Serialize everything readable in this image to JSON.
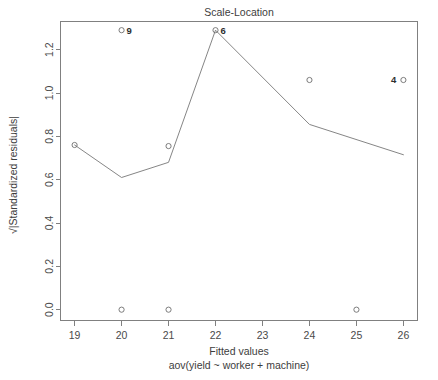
{
  "chart_data": {
    "type": "scatter",
    "title": "Scale-Location",
    "xlabel": "Fitted values",
    "sublabel": "aov(yield ~ worker + machine)",
    "ylabel": "√|Standardized residuals|",
    "ylabel_radical": "√",
    "ylabel_text": "|Standardized residuals|",
    "xlim": [
      18.7,
      26.3
    ],
    "ylim": [
      -0.05,
      1.33
    ],
    "grid": false,
    "legend": "none",
    "x_ticks": [
      "19",
      "20",
      "21",
      "22",
      "23",
      "24",
      "25",
      "26"
    ],
    "x_tick_values": [
      19,
      20,
      21,
      22,
      23,
      24,
      25,
      26
    ],
    "y_ticks": [
      "0.0",
      "0.2",
      "0.4",
      "0.6",
      "0.8",
      "1.0",
      "1.2"
    ],
    "y_tick_values": [
      0.0,
      0.2,
      0.4,
      0.6,
      0.8,
      1.0,
      1.2
    ],
    "points": [
      {
        "x": 19.0,
        "y": 0.76,
        "label": "",
        "label_side": "none"
      },
      {
        "x": 20.0,
        "y": 1.29,
        "label": "9",
        "label_side": "right"
      },
      {
        "x": 20.0,
        "y": 0.0,
        "label": "",
        "label_side": "none"
      },
      {
        "x": 21.0,
        "y": 0.755,
        "label": "",
        "label_side": "none"
      },
      {
        "x": 21.0,
        "y": 0.0,
        "label": "",
        "label_side": "none"
      },
      {
        "x": 22.0,
        "y": 1.29,
        "label": "6",
        "label_side": "right"
      },
      {
        "x": 24.0,
        "y": 1.06,
        "label": "",
        "label_side": "none"
      },
      {
        "x": 25.0,
        "y": 0.0,
        "label": "",
        "label_side": "none"
      },
      {
        "x": 26.0,
        "y": 1.06,
        "label": "4",
        "label_side": "left"
      }
    ],
    "series": [
      {
        "name": "lowess smooth",
        "x": [
          19.0,
          20.0,
          21.0,
          22.0,
          24.0,
          26.0
        ],
        "values": [
          0.76,
          0.61,
          0.68,
          1.29,
          0.855,
          0.715
        ]
      }
    ],
    "colors": {
      "axis": "#808080",
      "point": "#6e6e6e",
      "line": "#777777",
      "text": "#3d3d3d",
      "background": "#ffffff"
    }
  }
}
